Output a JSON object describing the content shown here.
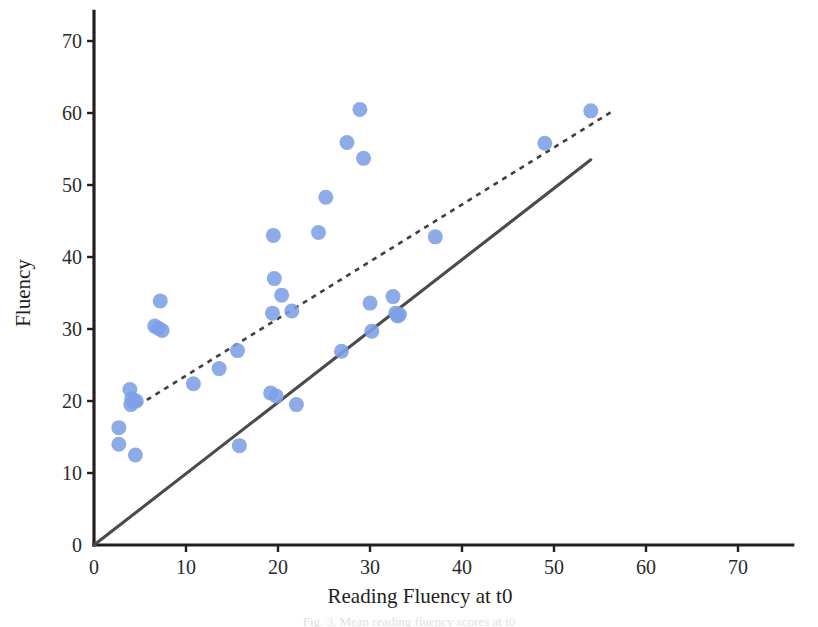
{
  "figure": {
    "caption": "Fig. 3. Mean reading fluency scores at t0",
    "background_color": "#ffffff"
  },
  "chart_data": {
    "type": "scatter",
    "title": "",
    "xlabel": "Reading Fluency at t0",
    "ylabel": "Fluency",
    "xlim": [
      0,
      74
    ],
    "ylim": [
      0,
      73
    ],
    "xticks": [
      0,
      10,
      20,
      30,
      40,
      50,
      60,
      70
    ],
    "yticks": [
      0,
      10,
      20,
      30,
      40,
      50,
      60,
      70
    ],
    "xtick_labels": [
      "0",
      "10",
      "20",
      "30",
      "40",
      "50",
      "60",
      "70"
    ],
    "ytick_labels": [
      "0",
      "10",
      "20",
      "30",
      "40",
      "50",
      "60",
      "70"
    ],
    "grid": false,
    "legend": "none",
    "marker_color": "#7d9fe6",
    "marker_radius": 7.5,
    "points": [
      {
        "x": 2.7,
        "y": 16.3
      },
      {
        "x": 2.7,
        "y": 14.0
      },
      {
        "x": 4.5,
        "y": 12.5
      },
      {
        "x": 3.9,
        "y": 21.6
      },
      {
        "x": 4.1,
        "y": 20.3
      },
      {
        "x": 4.3,
        "y": 19.9
      },
      {
        "x": 4.0,
        "y": 19.5
      },
      {
        "x": 4.6,
        "y": 20.0
      },
      {
        "x": 6.6,
        "y": 30.4
      },
      {
        "x": 7.0,
        "y": 30.1
      },
      {
        "x": 7.4,
        "y": 29.8
      },
      {
        "x": 7.2,
        "y": 33.9
      },
      {
        "x": 10.8,
        "y": 22.4
      },
      {
        "x": 13.6,
        "y": 24.5
      },
      {
        "x": 15.6,
        "y": 27.0
      },
      {
        "x": 15.8,
        "y": 13.8
      },
      {
        "x": 19.2,
        "y": 21.1
      },
      {
        "x": 19.8,
        "y": 20.7
      },
      {
        "x": 22.0,
        "y": 19.5
      },
      {
        "x": 19.4,
        "y": 32.2
      },
      {
        "x": 19.6,
        "y": 37.0
      },
      {
        "x": 20.4,
        "y": 34.7
      },
      {
        "x": 19.5,
        "y": 43.0
      },
      {
        "x": 21.5,
        "y": 32.5
      },
      {
        "x": 24.4,
        "y": 43.4
      },
      {
        "x": 25.2,
        "y": 48.3
      },
      {
        "x": 26.9,
        "y": 26.9
      },
      {
        "x": 27.5,
        "y": 55.9
      },
      {
        "x": 28.9,
        "y": 60.5
      },
      {
        "x": 29.3,
        "y": 53.7
      },
      {
        "x": 30.0,
        "y": 33.6
      },
      {
        "x": 30.2,
        "y": 29.7
      },
      {
        "x": 32.5,
        "y": 34.5
      },
      {
        "x": 32.8,
        "y": 32.2
      },
      {
        "x": 33.0,
        "y": 31.8
      },
      {
        "x": 33.2,
        "y": 32.0
      },
      {
        "x": 37.1,
        "y": 42.8
      },
      {
        "x": 49.0,
        "y": 55.8
      },
      {
        "x": 54.0,
        "y": 60.3
      }
    ],
    "lines": [
      {
        "name": "identity-line",
        "style": "solid",
        "color": "#4b4b4e",
        "x0": 0.0,
        "y0": 0.0,
        "x1": 54.0,
        "y1": 53.5
      },
      {
        "name": "regression-trend-line",
        "style": "dashed",
        "color": "#3f3f44",
        "x0": 4.8,
        "y0": 19.4,
        "x1": 56.3,
        "y1": 60.2
      }
    ]
  }
}
